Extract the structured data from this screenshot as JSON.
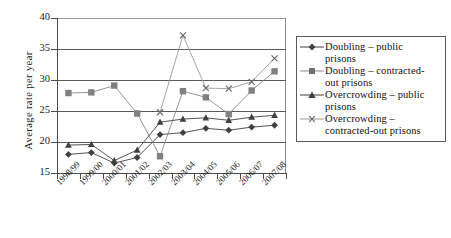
{
  "chart_data": {
    "type": "line",
    "title": "",
    "xlabel": "",
    "ylabel": "Average rate per year",
    "categories": [
      "1998/99",
      "1999/00",
      "2000/01",
      "2001/02",
      "2002/03",
      "2003/04",
      "2004/05",
      "2005/06",
      "2006/07",
      "2007/08"
    ],
    "ylim": [
      15,
      40
    ],
    "yticks": [
      15,
      20,
      25,
      30,
      35,
      40
    ],
    "grid": true,
    "legend_position": "right",
    "series": [
      {
        "name": "Doubling – public prisons",
        "marker": "diamond",
        "color": "#404040",
        "values": [
          18.0,
          18.3,
          16.6,
          17.5,
          21.2,
          21.5,
          22.2,
          21.9,
          22.4,
          22.7
        ]
      },
      {
        "name": "Doubling – contracted-out prisons",
        "marker": "square",
        "color": "#808080",
        "values": [
          27.9,
          28.0,
          29.1,
          24.6,
          17.7,
          28.2,
          27.2,
          24.5,
          28.3,
          31.4
        ]
      },
      {
        "name": "Overcrowding – public prisons",
        "marker": "triangle",
        "color": "#404040",
        "values": [
          19.5,
          19.6,
          17.0,
          18.7,
          23.2,
          23.7,
          23.9,
          23.5,
          24.0,
          24.3
        ]
      },
      {
        "name": "Overcrowding – contracted-out prisons",
        "marker": "x",
        "color": "#9a9a9a",
        "values": [
          null,
          null,
          null,
          null,
          24.8,
          37.2,
          28.7,
          28.6,
          29.7,
          33.5
        ]
      }
    ]
  },
  "legend": {
    "items": [
      {
        "label_line1": "Doubling – public",
        "label_line2": "prisons",
        "marker": "diamond"
      },
      {
        "label_line1": "Doubling – contracted-",
        "label_line2": "out prisons",
        "marker": "square"
      },
      {
        "label_line1": "Overcrowding – public",
        "label_line2": "prisons",
        "marker": "triangle"
      },
      {
        "label_line1": "Overcrowding –",
        "label_line2": "contracted-out prisons",
        "marker": "x"
      }
    ]
  },
  "axis": {
    "y_title": "Average rate per year",
    "y_labels": [
      "40",
      "35",
      "30",
      "25",
      "20",
      "15"
    ],
    "x_labels": [
      "1998/99",
      "1999/00",
      "2000/01",
      "2001/02",
      "2002/03",
      "2003/04",
      "2004/05",
      "2005/06",
      "2006/07",
      "2007/08"
    ]
  }
}
